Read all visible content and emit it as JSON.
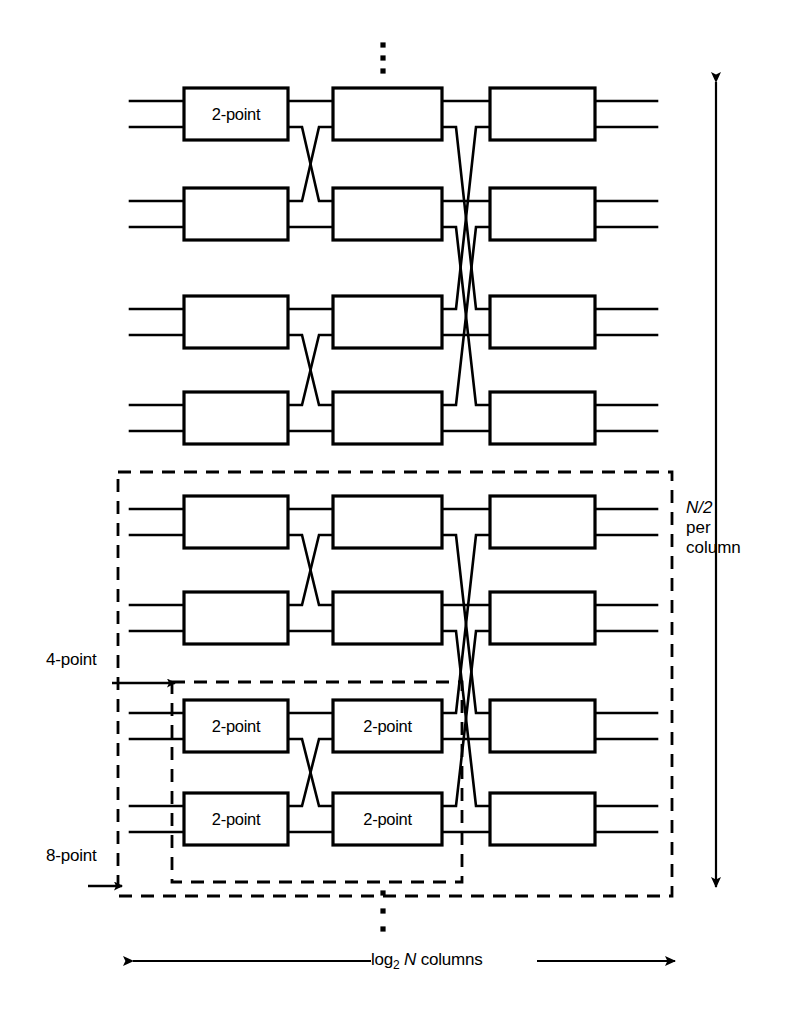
{
  "figure": {
    "type": "diagram"
  },
  "labels": {
    "two_point": "2-point",
    "four_point": "4-point",
    "eight_point": "8-point",
    "rows_italic": "N/2",
    "rows_line2": "per",
    "rows_line3": "column",
    "columns_pre": "log",
    "columns_sub": "2",
    "columns_italic": "N",
    "columns_post": " columns"
  },
  "colors": {
    "line": "#000000",
    "background": "#ffffff",
    "dashed": "#000000"
  },
  "geometry": {
    "columns": [
      {
        "name": "column-1",
        "x": 184,
        "width": 104
      },
      {
        "name": "column-2",
        "x": 333,
        "width": 109
      },
      {
        "name": "column-3",
        "x": 490,
        "width": 105
      }
    ],
    "rows": [
      88,
      188,
      296,
      392,
      496,
      592,
      700,
      793
    ],
    "box_height": 52,
    "input_stub_x": 130,
    "output_stub_x2": 657
  },
  "boxes": [
    {
      "row": 0,
      "col": 0,
      "label": "2-point"
    },
    {
      "row": 0,
      "col": 1,
      "label": ""
    },
    {
      "row": 0,
      "col": 2,
      "label": ""
    },
    {
      "row": 1,
      "col": 0,
      "label": ""
    },
    {
      "row": 1,
      "col": 1,
      "label": ""
    },
    {
      "row": 1,
      "col": 2,
      "label": ""
    },
    {
      "row": 2,
      "col": 0,
      "label": ""
    },
    {
      "row": 2,
      "col": 1,
      "label": ""
    },
    {
      "row": 2,
      "col": 2,
      "label": ""
    },
    {
      "row": 3,
      "col": 0,
      "label": ""
    },
    {
      "row": 3,
      "col": 1,
      "label": ""
    },
    {
      "row": 3,
      "col": 2,
      "label": ""
    },
    {
      "row": 4,
      "col": 0,
      "label": ""
    },
    {
      "row": 4,
      "col": 1,
      "label": ""
    },
    {
      "row": 4,
      "col": 2,
      "label": ""
    },
    {
      "row": 5,
      "col": 0,
      "label": ""
    },
    {
      "row": 5,
      "col": 1,
      "label": ""
    },
    {
      "row": 5,
      "col": 2,
      "label": ""
    },
    {
      "row": 6,
      "col": 0,
      "label": "2-point"
    },
    {
      "row": 6,
      "col": 1,
      "label": "2-point"
    },
    {
      "row": 6,
      "col": 2,
      "label": ""
    },
    {
      "row": 7,
      "col": 0,
      "label": "2-point"
    },
    {
      "row": 7,
      "col": 1,
      "label": "2-point"
    },
    {
      "row": 7,
      "col": 2,
      "label": ""
    }
  ],
  "dashed_boxes": [
    {
      "name": "eight-point-region",
      "x": 118,
      "y": 472,
      "width": 554,
      "height": 424
    },
    {
      "name": "four-point-region",
      "x": 172,
      "y": 682,
      "width": 290,
      "height": 200
    }
  ],
  "ellipses": {
    "top_dots": {
      "x": 383,
      "ys": [
        45,
        58,
        71
      ]
    },
    "bottom_dots": {
      "x": 383,
      "ys": [
        893,
        911,
        929
      ]
    }
  },
  "arrows": {
    "vertical_rows": {
      "x": 716,
      "y_top": 82,
      "y_bottom": 887,
      "double_headed": true
    },
    "horizontal_columns": {
      "y": 961,
      "x_left": 133,
      "x_right": 675,
      "double_headed": true
    },
    "four_point_pointer": {
      "x_from": 112,
      "x_to": 175,
      "y": 683
    },
    "eight_point_pointer": {
      "x_from": 88,
      "x_to": 122,
      "y": 886
    }
  }
}
